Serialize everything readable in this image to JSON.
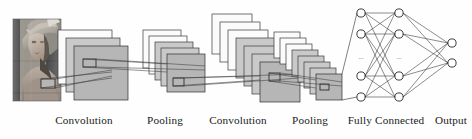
{
  "figure": {
    "width": 472,
    "height": 139,
    "background_color": "#fefefe"
  },
  "colors": {
    "feature_map_fill": "#b6b6b6",
    "feature_map_back_fill": "#fbfbfb",
    "feature_map_mid_fill": "#c9c9c9",
    "stroke": "#2e2e2e",
    "neuron_fill": "#ffffff",
    "neuron_stroke": "#1a1a1a",
    "label_color": "#1a1a1a",
    "link_color": "#3c3c3c"
  },
  "input": {
    "name": "lena-input-image",
    "description": "grayscale photograph input",
    "x": 13,
    "y": 19,
    "width": 48,
    "height": 82,
    "patch": {
      "x": 41,
      "y": 79,
      "width": 14,
      "height": 9
    }
  },
  "stages": [
    {
      "id": "conv1",
      "label": "Convolution",
      "label_x": 84,
      "label_y": 124,
      "map_count": 3,
      "map_size": 54,
      "front_x": 74,
      "front_y": 46,
      "offset_x": -8,
      "offset_y": -8,
      "patch": {
        "x": 83,
        "y": 59,
        "width": 13,
        "height": 8
      }
    },
    {
      "id": "pool1",
      "label": "Pooling",
      "label_x": 165,
      "label_y": 124,
      "map_count": 5,
      "map_size": 38,
      "front_x": 167,
      "front_y": 54,
      "offset_x": -6,
      "offset_y": -6,
      "patch": {
        "x": 173,
        "y": 78,
        "width": 11,
        "height": 8
      }
    },
    {
      "id": "conv2",
      "label": "Convolution",
      "label_x": 238,
      "label_y": 124,
      "map_count": 7,
      "map_size": 40,
      "front_x": 260,
      "front_y": 62,
      "offset_x": -8,
      "offset_y": -8,
      "patch": {
        "x": 269,
        "y": 73,
        "width": 11,
        "height": 8
      }
    },
    {
      "id": "pool2",
      "label": "Pooling",
      "label_x": 310,
      "label_y": 124,
      "map_count": 8,
      "map_size": 26,
      "front_x": 316,
      "front_y": 74,
      "offset_x": -6,
      "offset_y": -6,
      "patch": {
        "x": 320,
        "y": 84,
        "width": 9,
        "height": 6
      }
    }
  ],
  "fully_connected": {
    "label": "Fully Connected",
    "label_x": 386,
    "label_y": 124,
    "neuron_radius": 4.1,
    "columns": [
      {
        "x": 361,
        "ys": [
          13,
          34,
          76,
          97
        ]
      },
      {
        "x": 399,
        "ys": [
          13,
          34,
          76,
          97
        ]
      }
    ],
    "ellipsis": [
      {
        "x": 361,
        "y": 57,
        "text": "..."
      },
      {
        "x": 399,
        "y": 57,
        "text": "..."
      }
    ]
  },
  "output": {
    "label": "Output",
    "label_x": 451,
    "label_y": 124,
    "neuron_radius": 4.1,
    "x": 452,
    "ys": [
      43,
      63
    ]
  },
  "labels": [
    "Convolution",
    "Pooling",
    "Convolution",
    "Pooling",
    "Fully Connected",
    "Output"
  ]
}
